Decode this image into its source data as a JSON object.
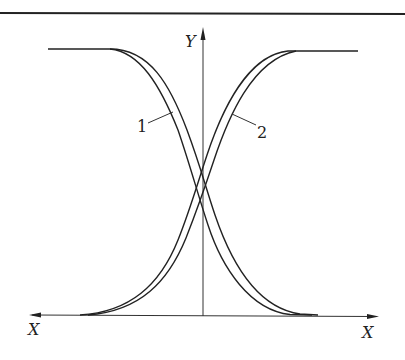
{
  "figure": {
    "axes": {
      "y_label": "Y",
      "x_label_left": "X",
      "x_label_right": "X"
    },
    "curve_labels": [
      {
        "id": "1",
        "text": "1"
      },
      {
        "id": "2",
        "text": "2"
      }
    ],
    "colors": {
      "stroke": "#222222",
      "background": "#ffffff"
    }
  }
}
